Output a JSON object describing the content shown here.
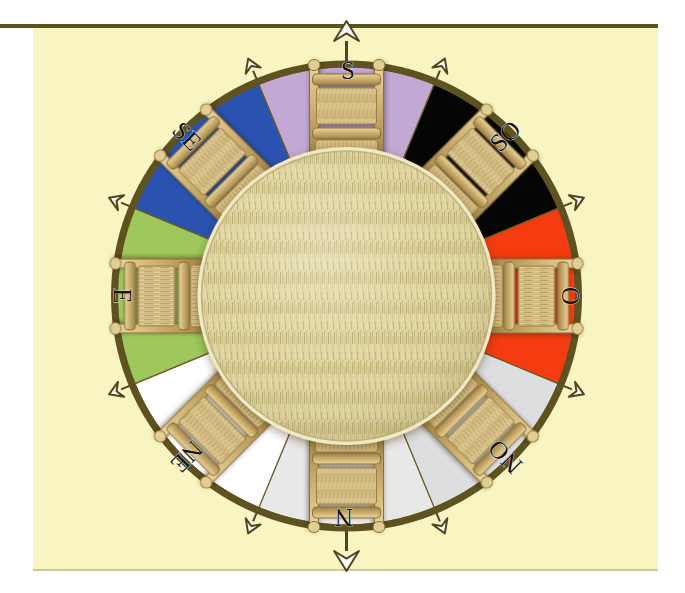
{
  "page": {
    "background_color": "#ffffff",
    "paper_color": "#f8f5c2",
    "rule_color": "#5d5220"
  },
  "diagram": {
    "type": "compass-rose-seating-plan",
    "center_label": "",
    "ring_border_color": "#5d5220",
    "table": {
      "name": "round-table",
      "surface": "woven straw",
      "color": "#ddd29a"
    },
    "seats_count": 8,
    "chair_color": "#c9a961",
    "sectors": [
      {
        "label": "S",
        "name": "sector-s",
        "color": "#c4a8d4",
        "angle_deg": 270,
        "chair": true
      },
      {
        "label": "SO",
        "name": "sector-so",
        "color": "#050505",
        "angle_deg": 315,
        "chair": true
      },
      {
        "label": "O",
        "name": "sector-o",
        "color": "#f43c10",
        "angle_deg": 0,
        "chair": true
      },
      {
        "label": "NO",
        "name": "sector-no",
        "color": "#dcdee0",
        "angle_deg": 45,
        "chair": true
      },
      {
        "label": "N",
        "name": "sector-n",
        "color": "#e8e8e6",
        "angle_deg": 90,
        "chair": true
      },
      {
        "label": "NE",
        "name": "sector-ne",
        "color": "#ffffff",
        "angle_deg": 135,
        "chair": true
      },
      {
        "label": "E",
        "name": "sector-e",
        "color": "#9fc85c",
        "angle_deg": 180,
        "chair": true
      },
      {
        "label": "SE",
        "name": "sector-se",
        "color": "#2a53b0",
        "angle_deg": 225,
        "chair": true
      }
    ],
    "compass_labels": [
      {
        "text": "S",
        "x": 348,
        "y": 73,
        "rotate": 0
      },
      {
        "text": "SO",
        "x": 507,
        "y": 138,
        "rotate": -45
      },
      {
        "text": "O",
        "x": 573,
        "y": 296,
        "rotate": -90
      },
      {
        "text": "NO",
        "x": 507,
        "y": 455,
        "rotate": -135
      },
      {
        "text": "N",
        "x": 344,
        "y": 515,
        "rotate": 180
      },
      {
        "text": "NE",
        "x": 185,
        "y": 455,
        "rotate": 135
      },
      {
        "text": "E",
        "x": 120,
        "y": 296,
        "rotate": 90
      },
      {
        "text": "SE",
        "x": 185,
        "y": 138,
        "rotate": 45
      }
    ],
    "arrow_markers": {
      "count": 17,
      "color_fill": "#ffffff",
      "color_stroke": "#4e4520",
      "cardinal_big": [
        "S",
        "N"
      ]
    }
  }
}
